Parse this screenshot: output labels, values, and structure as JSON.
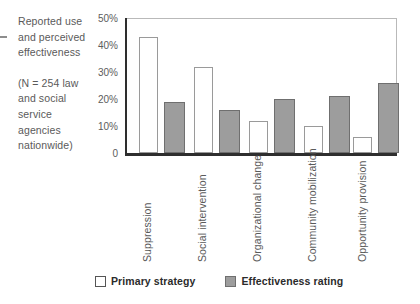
{
  "caption": {
    "paragraph1": "Reported use and perceived effectiveness",
    "paragraph2": "(N = 254 law and social service agencies nationwide)"
  },
  "legend": {
    "items": [
      {
        "label": "Primary strategy",
        "swatch": "white-square-swatch",
        "color": "#ffffff"
      },
      {
        "label": "Effectiveness rating",
        "swatch": "gray-square-swatch",
        "color": "#9d9d9d"
      }
    ]
  },
  "chart_data": {
    "type": "bar",
    "title": "Reported use and perceived effectiveness",
    "xlabel": "",
    "ylabel": "",
    "ylim": [
      0,
      50
    ],
    "grid": false,
    "legend_position": "bottom",
    "ytick_labels": [
      "50%",
      "40%",
      "30%",
      "20%",
      "10%",
      "0"
    ],
    "ytick_values": [
      50,
      40,
      30,
      20,
      10,
      0
    ],
    "categories": [
      "Suppression",
      "Social intervention",
      "Organizational change",
      "Community mobilization",
      "Opportunity provision"
    ],
    "series": [
      {
        "name": "Primary strategy",
        "color": "#ffffff",
        "values": [
          43,
          32,
          12,
          10,
          6
        ]
      },
      {
        "name": "Effectiveness rating",
        "color": "#9d9d9d",
        "values": [
          19,
          16,
          20,
          21,
          26
        ]
      }
    ]
  }
}
